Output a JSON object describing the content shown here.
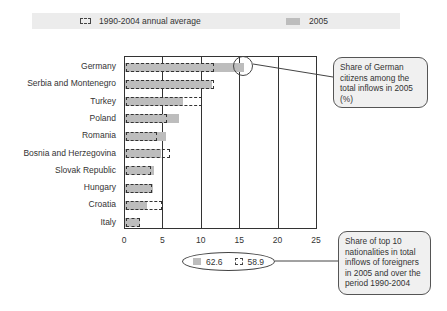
{
  "legend": {
    "average_label": "1990-2004 annual average",
    "current_label": "2005"
  },
  "annotations": {
    "german_share": "Share of German citizens among the total inflows in 2005 (%)",
    "top10_share": "Share of top 10 nationalities in total inflows of foreigners in 2005 and over the period 1990-2004",
    "top10_2005_value": "62.6",
    "top10_avg_value": "58.9"
  },
  "colors": {
    "bar_2005": "#bdbdbd",
    "dashed_outline": "#333333",
    "legend_band": "#ececec",
    "note_fill": "#f0f0f0"
  },
  "chart_data": {
    "type": "bar",
    "orientation": "horizontal",
    "title": "",
    "xlabel": "",
    "ylabel": "",
    "xlim": [
      0,
      25
    ],
    "xticks": [
      0,
      5,
      10,
      15,
      20,
      25
    ],
    "grid": true,
    "legend_position": "top",
    "categories": [
      "Germany",
      "Serbia and Montenegro",
      "Turkey",
      "Poland",
      "Romania",
      "Bosnia and Herzegovina",
      "Slovak Republic",
      "Hungary",
      "Croatia",
      "Italy"
    ],
    "series": [
      {
        "name": "2005",
        "style": "solid-gray",
        "values": [
          15.5,
          11.3,
          7.5,
          7.0,
          5.3,
          4.7,
          3.8,
          3.6,
          2.8,
          1.9
        ]
      },
      {
        "name": "1990-2004 annual average",
        "style": "dashed-outline",
        "values": [
          11.4,
          11.4,
          9.9,
          5.3,
          4.1,
          5.7,
          3.2,
          3.4,
          4.7,
          1.8
        ]
      }
    ],
    "annotations": [
      {
        "target": "Germany 2005",
        "text": "Share of German citizens among the total inflows in 2005 (%)"
      },
      {
        "target": "Top 10 total",
        "text": "Share of top 10 nationalities in total inflows of foreigners in 2005 and over the period 1990-2004",
        "values": {
          "2005": 62.6,
          "1990-2004 annual average": 58.9
        }
      }
    ]
  }
}
